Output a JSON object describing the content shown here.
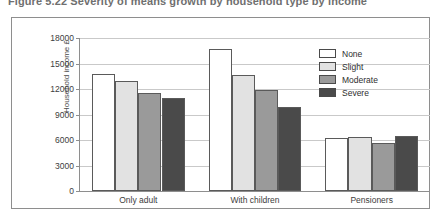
{
  "figure": {
    "title": "Figure 5.22   Severity of means growth by household type by income"
  },
  "chart_data": {
    "type": "bar",
    "title": "Figure 5.22   Severity of means growth by household type by income",
    "xlabel": "",
    "ylabel": "Household income £",
    "ylim": [
      0,
      18000
    ],
    "ytick_step": 3000,
    "yticks": [
      0,
      3000,
      6000,
      9000,
      12000,
      15000,
      18000
    ],
    "ytick_labels": [
      "0",
      "3000",
      "6000",
      "9000",
      "12000",
      "15000",
      "18000"
    ],
    "grid": "horizontal",
    "legend_position": "top-right-inside",
    "categories": [
      "Only adult",
      "With children",
      "Pensioners"
    ],
    "series": [
      {
        "name": "None",
        "color": "#ffffff",
        "values": [
          13800,
          16700,
          6200
        ]
      },
      {
        "name": "Slight",
        "color": "#e2e2e2",
        "values": [
          12900,
          13700,
          6300
        ]
      },
      {
        "name": "Moderate",
        "color": "#9a9a9a",
        "values": [
          11500,
          11900,
          5700
        ]
      },
      {
        "name": "Severe",
        "color": "#4a4a4a",
        "values": [
          11000,
          9900,
          6500
        ]
      }
    ]
  },
  "colors": {
    "border": "#8e8e8e",
    "gridline": "#c9c9c9",
    "bar_outline": "#5a5a5a",
    "text": "#3d3d3d",
    "title_text": "#6f6f6f"
  }
}
